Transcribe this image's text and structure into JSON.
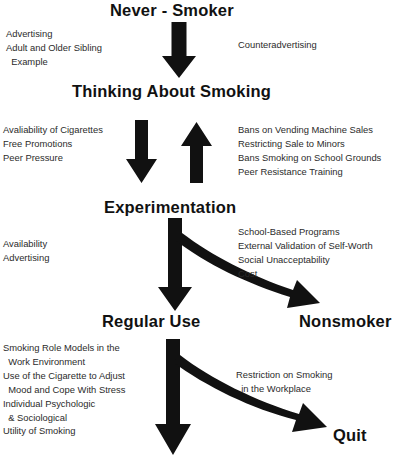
{
  "diagram": {
    "ink_color": "#111111",
    "background_color": "#ffffff"
  },
  "stages": [
    {
      "id": "never-smoker",
      "label": "Never - Smoker"
    },
    {
      "id": "thinking-about-smoking",
      "label": "Thinking About Smoking"
    },
    {
      "id": "experimentation",
      "label": "Experimentation"
    },
    {
      "id": "regular-use",
      "label": "Regular Use"
    },
    {
      "id": "nonsmoker",
      "label": "Nonsmoker"
    },
    {
      "id": "quit",
      "label": "Quit"
    }
  ],
  "notes": {
    "never_to_thinking_left": "Advertising\nAdult and Older Sibling\n  Example",
    "never_to_thinking_right": "Counteradvertising",
    "thinking_to_experimentation_left": "Avaliability of Cigarettes\nFree Promotions\nPeer Pressure",
    "experimentation_to_thinking_right": "Bans on Vending Machine Sales\nRestricting Sale to Minors\nBans Smoking on School Grounds\nPeer Resistance Training",
    "experimentation_to_regular_left": "Availability\nAdvertising",
    "experimentation_to_nonsmoker_right": "School-Based Programs\nExternal Validation of Self-Worth\nSocial Unacceptability\nCost",
    "regular_use_left": "Smoking Role Models in the\n  Work Environment\nUse of the Cigarette to Adjust\n  Mood and Cope With Stress\nIndividual Psychologic\n  & Sociological\nUtility of Smoking",
    "regular_to_quit_right": "Restriction on Smoking\n  in the Workplace"
  },
  "arrows": [
    {
      "id": "never-to-thinking",
      "kind": "straight-down"
    },
    {
      "id": "thinking-to-experimentation",
      "kind": "straight-down"
    },
    {
      "id": "experimentation-to-thinking",
      "kind": "straight-up"
    },
    {
      "id": "experimentation-to-regular-use",
      "kind": "straight-down"
    },
    {
      "id": "experimentation-to-nonsmoker",
      "kind": "curved-right-down"
    },
    {
      "id": "regular-use-to-bottom",
      "kind": "straight-down"
    },
    {
      "id": "regular-use-to-quit",
      "kind": "curved-right-down"
    }
  ]
}
